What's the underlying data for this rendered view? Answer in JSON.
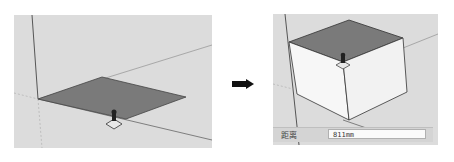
{
  "figure": {
    "left_step": {
      "description": "Rectangle face drawn on ground plane with Push/Pull cursor",
      "face_color": "#7a7a7a",
      "background_color": "#dcdcdc"
    },
    "arrow": {
      "icon": "right-arrow-icon",
      "color": "#111111"
    },
    "right_step": {
      "description": "Face pushed up into a box",
      "top_face_color": "#7a7a7a",
      "side_face_color": "#f7f7f7",
      "background_color": "#dcdcdc",
      "status_bar": {
        "label": "距离",
        "value": "811mm"
      }
    }
  }
}
